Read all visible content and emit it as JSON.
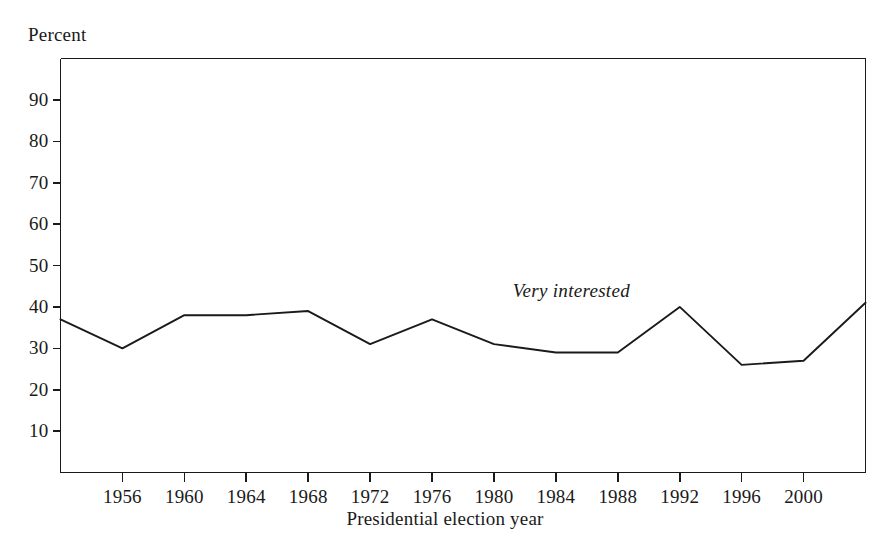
{
  "chart_data": {
    "type": "line",
    "title": "",
    "subtitle": "",
    "xlabel": "Presidential election year",
    "ylabel": "Percent",
    "x": [
      1952,
      1956,
      1960,
      1964,
      1968,
      1972,
      1976,
      1980,
      1984,
      1988,
      1992,
      1996,
      2000,
      2004
    ],
    "series": [
      {
        "name": "Very interested",
        "values": [
          37,
          30,
          38,
          38,
          39,
          31,
          37,
          31,
          29,
          29,
          40,
          26,
          27,
          41
        ]
      }
    ],
    "annotations": [
      {
        "text": "Very interested",
        "x": 1985,
        "y": 44,
        "style": "italic"
      }
    ],
    "xlim": [
      1952,
      2004
    ],
    "ylim": [
      0,
      100
    ],
    "x_tick_values": [
      1956,
      1960,
      1964,
      1968,
      1972,
      1976,
      1980,
      1984,
      1988,
      1992,
      1996,
      2000
    ],
    "x_tick_labels": [
      "1956",
      "1960",
      "1964",
      "1968",
      "1972",
      "1976",
      "1980",
      "1984",
      "1988",
      "1992",
      "1996",
      "2000"
    ],
    "y_tick_values": [
      10,
      20,
      30,
      40,
      50,
      60,
      70,
      80,
      90
    ],
    "y_tick_labels": [
      "10",
      "20",
      "30",
      "40",
      "50",
      "60",
      "70",
      "80",
      "90"
    ],
    "grid": false,
    "legend": "none",
    "line_color": "#1a1a1a",
    "background_color": "#ffffff",
    "frame_color": "#1a1a1a"
  }
}
